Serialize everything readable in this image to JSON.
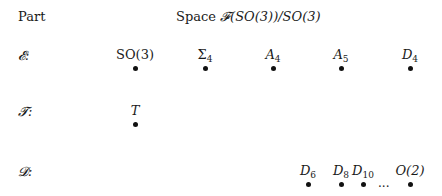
{
  "header": {
    "part_label": "Part",
    "space_label": "Space ",
    "space_formula": "𝓕(SO(3))/SO(3)"
  },
  "rows": [
    {
      "label": "𝓔:",
      "nodes": [
        {
          "base": "SO(3)",
          "sub": "",
          "italic": false,
          "x": 135
        },
        {
          "base": "Σ",
          "sub": "4",
          "italic": false,
          "x": 205
        },
        {
          "base": "A",
          "sub": "4",
          "italic": true,
          "x": 273
        },
        {
          "base": "A",
          "sub": "5",
          "italic": true,
          "x": 341
        },
        {
          "base": "D",
          "sub": "4",
          "italic": true,
          "x": 410
        }
      ]
    },
    {
      "label": "𝓣:",
      "nodes": [
        {
          "base": "T",
          "sub": "",
          "italic": true,
          "x": 135
        }
      ]
    },
    {
      "label": "𝓓:",
      "nodes": [
        {
          "base": "D",
          "sub": "6",
          "italic": true,
          "x": 308
        },
        {
          "base": "D",
          "sub": "8",
          "italic": true,
          "x": 341
        },
        {
          "base": "D",
          "sub": "10",
          "italic": true,
          "x": 362
        },
        {
          "base": "O(2)",
          "sub": "",
          "italic": true,
          "x": 410
        }
      ],
      "ellipsis": "..."
    }
  ]
}
